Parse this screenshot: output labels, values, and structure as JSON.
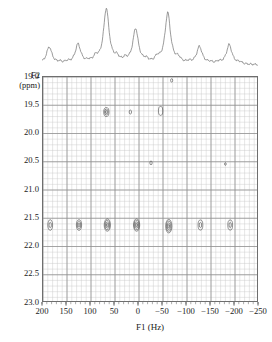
{
  "chart_data": {
    "type": "scatter",
    "title": "",
    "subtitle": "",
    "xlabel": "F1 (Hz)",
    "ylabel": "F2",
    "ylabel_unit": "(ppm)",
    "xlim": [
      200,
      -250
    ],
    "ylim": [
      19.0,
      23.0
    ],
    "x_reversed": true,
    "y_reversed": true,
    "grid": true,
    "legend": "none",
    "xticks": [
      200,
      150,
      100,
      50,
      0,
      -50,
      -100,
      -150,
      -200,
      -250
    ],
    "xticklabels": [
      "200",
      "150",
      "100",
      "50",
      "0",
      "−50",
      "−100",
      "−150",
      "−200",
      "−250"
    ],
    "yticks": [
      19.0,
      19.5,
      20.0,
      20.5,
      21.0,
      21.5,
      22.0,
      22.5,
      23.0
    ],
    "yticklabels": [
      "19.0",
      "19.5",
      "20.0",
      "20.5",
      "21.0",
      "21.5",
      "22.0",
      "22.5",
      "23.0"
    ],
    "minor_grid_x_step": 10,
    "minor_grid_y_step": 0.1,
    "contour_peaks": [
      {
        "x": 185,
        "y": 21.62,
        "rx": 5.0,
        "ry": 9.5,
        "rings": 2,
        "label": "cross-peak-1"
      },
      {
        "x": 125,
        "y": 21.62,
        "rx": 5.5,
        "ry": 9.5,
        "rings": 3,
        "label": "cross-peak-2"
      },
      {
        "x": 66,
        "y": 21.62,
        "rx": 6.5,
        "ry": 11.0,
        "rings": 4,
        "label": "cross-peak-3"
      },
      {
        "x": 5,
        "y": 21.62,
        "rx": 6.5,
        "ry": 11.0,
        "rings": 4,
        "label": "cross-peak-4"
      },
      {
        "x": -62,
        "y": 21.64,
        "rx": 6.5,
        "ry": 12.0,
        "rings": 4,
        "label": "cross-peak-5"
      },
      {
        "x": -128,
        "y": 21.62,
        "rx": 5.0,
        "ry": 9.0,
        "rings": 2,
        "label": "cross-peak-6"
      },
      {
        "x": -190,
        "y": 21.62,
        "rx": 5.0,
        "ry": 9.0,
        "rings": 2,
        "label": "cross-peak-7"
      },
      {
        "x": 68,
        "y": 19.62,
        "rx": 5.5,
        "ry": 8.0,
        "rings": 3,
        "label": "cross-peak-8"
      },
      {
        "x": 18,
        "y": 19.62,
        "rx": 2.5,
        "ry": 3.5,
        "rings": 1,
        "label": "cross-peak-9"
      },
      {
        "x": -45,
        "y": 19.6,
        "rx": 4.5,
        "ry": 8.0,
        "rings": 1,
        "label": "cross-peak-10"
      },
      {
        "x": -68,
        "y": 19.06,
        "rx": 2.2,
        "ry": 3.0,
        "rings": 1,
        "label": "cross-peak-11"
      },
      {
        "x": -25,
        "y": 20.52,
        "rx": 2.4,
        "ry": 3.4,
        "rings": 1,
        "label": "cross-peak-12"
      },
      {
        "x": -180,
        "y": 20.54,
        "rx": 1.4,
        "ry": 2.4,
        "rings": 1,
        "label": "cross-peak-13"
      }
    ],
    "projection_1d": {
      "description": "1D projection spectrum along F1 shown above the contour plot",
      "peaks_hz": [
        185,
        125,
        66,
        5,
        -62,
        -128,
        -190
      ],
      "peak_heights": [
        0.3,
        0.34,
        0.95,
        0.6,
        0.88,
        0.3,
        0.34
      ]
    }
  },
  "axes": {
    "y_title": "F2",
    "y_unit": "(ppm)",
    "x_title": "F1 (Hz)"
  }
}
